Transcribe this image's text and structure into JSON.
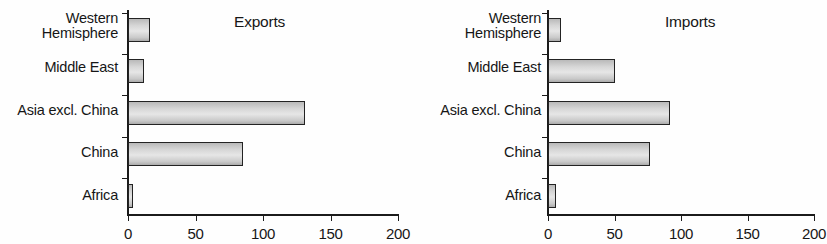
{
  "figure": {
    "background_color": "#ffffff",
    "bar_outline_color": "#232323",
    "bar_fill_color": "#d6d6d6",
    "axis_color": "#1b1b1b"
  },
  "chart_data": {
    "type": "bar",
    "orientation": "horizontal",
    "title": "",
    "categories": [
      "Western\nHemisphere",
      "Middle East",
      "Asia excl. China",
      "China",
      "Africa"
    ],
    "xlabel": "",
    "ylabel": "",
    "xlim": [
      0,
      200
    ],
    "xticks": [
      0,
      50,
      100,
      150,
      200
    ],
    "xticklabels": [
      "0",
      "50",
      "100",
      "150",
      "200"
    ],
    "grid": false,
    "legend": "none",
    "panels": [
      {
        "title": "Exports",
        "values": [
          16,
          12,
          131,
          85,
          4
        ]
      },
      {
        "title": "Imports",
        "values": [
          10,
          50,
          92,
          77,
          6
        ]
      }
    ],
    "series": [
      {
        "name": "Exports",
        "values": [
          16,
          12,
          131,
          85,
          4
        ]
      },
      {
        "name": "Imports",
        "values": [
          10,
          50,
          92,
          77,
          6
        ]
      }
    ]
  }
}
